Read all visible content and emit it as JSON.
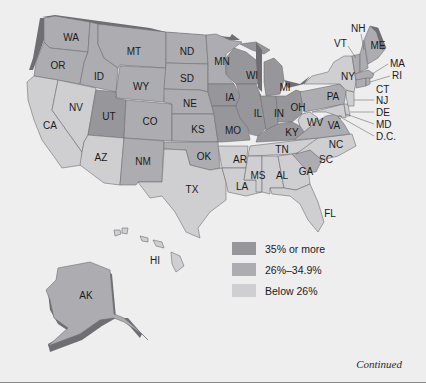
{
  "legend": {
    "items": [
      {
        "label": "35% or more",
        "color": "#97979b"
      },
      {
        "label": "26%–34.9%",
        "color": "#adadb1"
      },
      {
        "label": "Below 26%",
        "color": "#cfcfd2"
      }
    ]
  },
  "footer": {
    "continued": "Continued"
  },
  "states": {
    "WA": "WA",
    "OR": "OR",
    "CA": "CA",
    "ID": "ID",
    "NV": "NV",
    "MT": "MT",
    "WY": "WY",
    "UT": "UT",
    "AZ": "AZ",
    "CO": "CO",
    "NM": "NM",
    "ND": "ND",
    "SD": "SD",
    "NE": "NE",
    "KS": "KS",
    "OK": "OK",
    "TX": "TX",
    "MN": "MN",
    "IA": "IA",
    "MO": "MO",
    "AR": "AR",
    "LA": "LA",
    "WI": "WI",
    "IL": "IL",
    "MI": "MI",
    "IN": "IN",
    "OH": "OH",
    "KY": "KY",
    "TN": "TN",
    "MS": "MS",
    "AL": "AL",
    "GA": "GA",
    "FL": "FL",
    "SC": "SC",
    "NC": "NC",
    "VA": "VA",
    "WV": "WV",
    "PA": "PA",
    "NY": "NY",
    "VT": "VT",
    "NH": "NH",
    "ME": "ME",
    "MA": "MA",
    "RI": "RI",
    "CT": "CT",
    "NJ": "NJ",
    "DE": "DE",
    "MD": "MD",
    "DC": "D.C.",
    "AK": "AK",
    "HI": "HI"
  },
  "categories": {
    "high": [
      "UT",
      "IA",
      "IL",
      "IN",
      "MO",
      "MI",
      "OH",
      "WI",
      "KY"
    ],
    "mid": [
      "WA",
      "OR",
      "ID",
      "MT",
      "WY",
      "ND",
      "SD",
      "NE",
      "KS",
      "OK",
      "CO",
      "NM",
      "MN",
      "PA",
      "VA",
      "SC",
      "ME",
      "NH",
      "VT",
      "MA",
      "CT",
      "RI",
      "AK"
    ],
    "low": [
      "CA",
      "NV",
      "AZ",
      "TX",
      "AR",
      "LA",
      "MS",
      "AL",
      "GA",
      "FL",
      "TN",
      "NC",
      "WV",
      "NY",
      "NJ",
      "DE",
      "MD",
      "HI"
    ]
  }
}
